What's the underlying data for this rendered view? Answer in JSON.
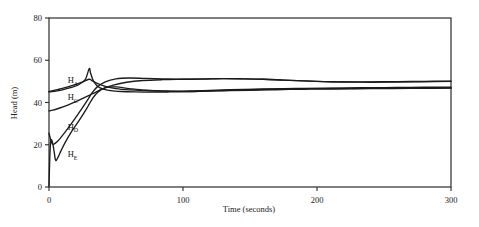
{
  "chart_data": {
    "type": "line",
    "title": "",
    "xlabel": "Time (seconds)",
    "ylabel": "Head (m)",
    "xlim": [
      0,
      300
    ],
    "ylim": [
      0,
      80
    ],
    "xticks": [
      0,
      100,
      200,
      300
    ],
    "yticks": [
      0,
      20,
      40,
      60,
      80
    ],
    "xtick_labels": [
      "0",
      "100",
      "200",
      "300"
    ],
    "ytick_labels": [
      "0",
      "20",
      "40",
      "60",
      "80"
    ],
    "grid": false,
    "legend": "inline-labels",
    "line_color": "#1b1b1b",
    "background": "#ffffff",
    "frame": "box",
    "series": [
      {
        "name": "H_A",
        "label": "H",
        "subscript": "A",
        "label_x": 14,
        "label_y": 49,
        "x": [
          0,
          3,
          8,
          14,
          20,
          26,
          30,
          32,
          36,
          42,
          50,
          60,
          70,
          85,
          100,
          115,
          130,
          145,
          160,
          175,
          190,
          205,
          220,
          240,
          260,
          280,
          300
        ],
        "y": [
          45.2,
          45.6,
          46.4,
          47.4,
          48.6,
          50.0,
          51.0,
          50.4,
          49.0,
          47.6,
          46.6,
          46.0,
          45.7,
          45.5,
          45.4,
          45.6,
          45.9,
          46.2,
          46.4,
          46.6,
          46.7,
          46.8,
          46.9,
          47.0,
          47.1,
          47.2,
          47.2
        ]
      },
      {
        "name": "H_C",
        "label": "H",
        "subscript": "C",
        "label_x": 14,
        "label_y": 41,
        "x": [
          0,
          3,
          8,
          14,
          20,
          26,
          30,
          34,
          40,
          48,
          58,
          70,
          85,
          100,
          115,
          130,
          145,
          160,
          175,
          190,
          205,
          220,
          240,
          260,
          280,
          300
        ],
        "y": [
          36.0,
          36.4,
          37.4,
          38.8,
          40.4,
          42.2,
          43.4,
          44.6,
          46.4,
          48.2,
          49.6,
          50.4,
          50.8,
          51.0,
          51.2,
          51.3,
          51.2,
          51.0,
          50.6,
          50.2,
          49.9,
          49.7,
          49.6,
          49.7,
          49.8,
          50.0
        ]
      },
      {
        "name": "H_D",
        "label": "H",
        "subscript": "D",
        "label_x": 14,
        "label_y": 27,
        "x": [
          0,
          1,
          2,
          3,
          4,
          6,
          8,
          12,
          16,
          20,
          24,
          28,
          30,
          32,
          36,
          42,
          50,
          60,
          72,
          85,
          100,
          115,
          130,
          145,
          160,
          175,
          190,
          205,
          220,
          240,
          260,
          280,
          300
        ],
        "y": [
          25.5,
          23.0,
          21.0,
          20.2,
          20.4,
          21.4,
          22.8,
          26.0,
          29.4,
          33.0,
          36.6,
          40.4,
          42.4,
          44.4,
          47.4,
          49.8,
          51.2,
          51.6,
          51.4,
          51.2,
          51.0,
          51.1,
          51.3,
          51.2,
          51.0,
          50.6,
          50.2,
          49.9,
          49.8,
          49.8,
          49.9,
          50.0,
          50.1
        ]
      },
      {
        "name": "H_E",
        "label": "H",
        "subscript": "E",
        "label_x": 14,
        "label_y": 14,
        "x": [
          0,
          0.6,
          1.2,
          2,
          3,
          4,
          5,
          7,
          9,
          12,
          16,
          20,
          24,
          28,
          30,
          32,
          36,
          42,
          50,
          60,
          72,
          85,
          100,
          115,
          130,
          145,
          160,
          175,
          190,
          205,
          220,
          240,
          260,
          280,
          300
        ],
        "y": [
          0.5,
          14.0,
          21.0,
          22.3,
          20.0,
          16.0,
          12.6,
          14.4,
          17.2,
          21.0,
          25.4,
          29.2,
          33.0,
          37.0,
          39.2,
          41.4,
          44.6,
          47.0,
          47.4,
          46.6,
          45.8,
          45.4,
          45.2,
          45.4,
          45.7,
          46.0,
          46.2,
          46.4,
          46.5,
          46.6,
          46.6,
          46.7,
          46.8,
          46.8,
          46.9
        ]
      },
      {
        "name": "H_A_branch",
        "label": "",
        "subscript": "",
        "label_x": null,
        "label_y": null,
        "x": [
          0,
          4,
          10,
          16,
          22,
          27,
          30,
          31,
          33,
          36,
          40,
          46,
          54,
          64,
          76,
          90,
          105,
          120,
          135,
          150,
          165,
          180,
          195,
          210,
          230,
          250,
          270,
          300
        ],
        "y": [
          45.0,
          45.3,
          46.0,
          47.0,
          48.4,
          50.8,
          56.0,
          54.0,
          50.4,
          47.8,
          46.4,
          45.6,
          45.2,
          45.0,
          44.9,
          45.0,
          45.2,
          45.4,
          45.6,
          45.8,
          46.0,
          46.2,
          46.3,
          46.4,
          46.5,
          46.6,
          46.7,
          46.8
        ]
      }
    ],
    "annotations": [
      {
        "text": "H",
        "sub": "A",
        "value_at_t0": 45
      },
      {
        "text": "H",
        "sub": "C",
        "value_at_t0": 36
      },
      {
        "text": "H",
        "sub": "D",
        "value_at_t0": 25
      },
      {
        "text": "H",
        "sub": "E",
        "value_at_t0": 0
      }
    ]
  }
}
